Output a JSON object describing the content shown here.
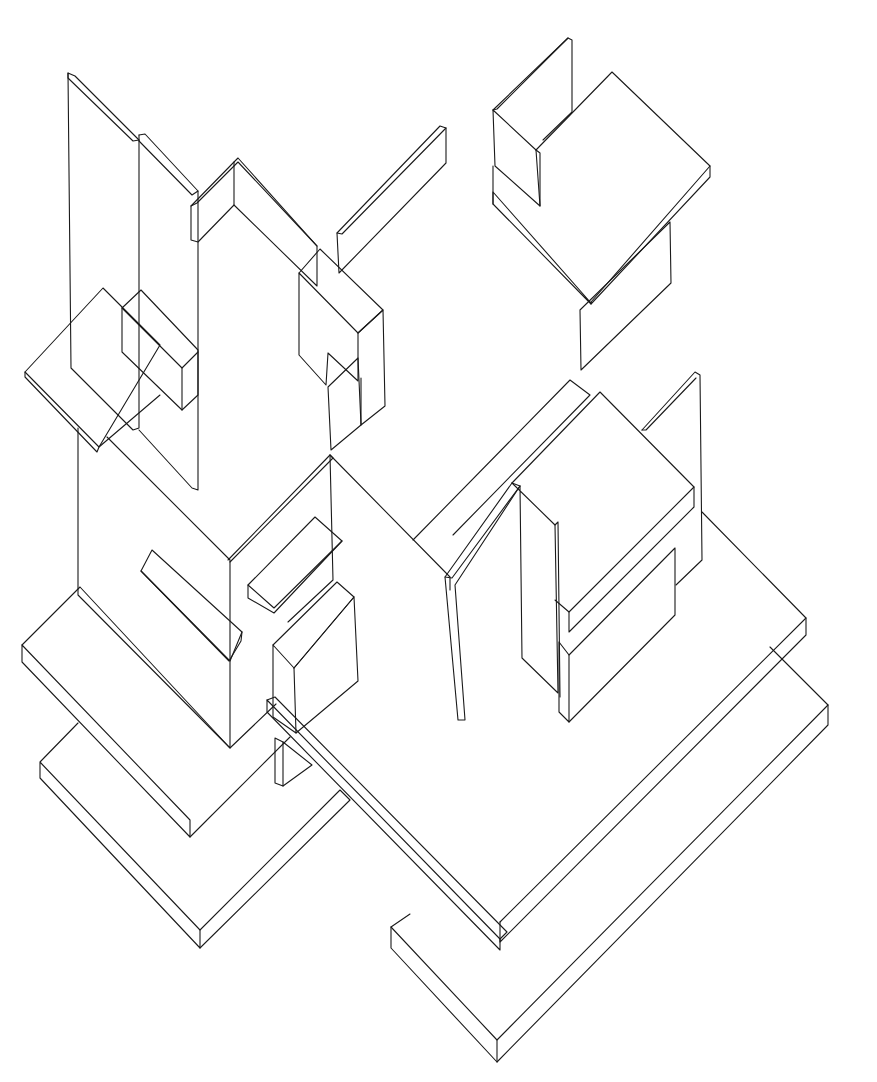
{
  "colors": {
    "background": "#ffffff",
    "ink": "#1a1a1a"
  },
  "shapes": [
    {
      "name": "tall-left-wall",
      "points": "68,73 75,76 139,140 139,428 133,430 71,368 68,73"
    },
    {
      "name": "tall-left-wall-edge",
      "points": "68,73 68,78 133,141 139,140"
    },
    {
      "name": "second-wall",
      "points": "139,135 145,134 198,191 198,490 192,488 139,430"
    },
    {
      "name": "second-wall-edge",
      "points": "139,135 139,141 192,195 198,191"
    },
    {
      "name": "top-l-wall-front",
      "points": "191,206 234,162 238,158 317,246 317,286 234,205 198,242 191,240 191,206"
    },
    {
      "name": "top-l-wall-edge",
      "points": "191,206 197,203 234,166 238,162 317,246"
    },
    {
      "name": "top-l-wall-corner",
      "points": "234,162 234,205"
    },
    {
      "name": "top-right-slat",
      "points": "337,233 440,126 446,128 446,163 339,273 337,233"
    },
    {
      "name": "top-right-slat-edge",
      "points": "337,233 342,234 446,128"
    },
    {
      "name": "middle-box-front",
      "points": "299,273 358,333 358,381 328,353 326,385 299,355 299,273"
    },
    {
      "name": "middle-box-top",
      "points": "299,273 320,249 383,310 358,333"
    },
    {
      "name": "middle-box-side",
      "points": "358,333 383,310 385,406 361,425 361,378"
    },
    {
      "name": "middle-box-lower",
      "points": "328,387 358,358 361,425 331,450 328,387"
    },
    {
      "name": "left-floating-slab-top",
      "points": "25,372 103,288 160,345 99,447 25,372"
    },
    {
      "name": "left-floating-slab-edge",
      "points": "25,372 25,377 97,452 99,447 160,395"
    },
    {
      "name": "left-shelf-box",
      "points": "122,308 141,290 198,350 198,395 182,410 122,352 122,308"
    },
    {
      "name": "left-shelf-box-edge",
      "points": "122,308 182,368 198,352"
    },
    {
      "name": "left-shelf-box-vertical",
      "points": "182,368 182,410"
    },
    {
      "name": "lower-left-wall",
      "points": "78,428 78,595 230,748 230,560 107,437"
    },
    {
      "name": "mid-v-wall-left",
      "points": "228,560 330,455 333,458 230,562"
    },
    {
      "name": "mid-v-wall-right",
      "points": "330,455 333,458 450,577 450,590"
    },
    {
      "name": "mid-center-wall",
      "points": "330,455 333,580 288,622"
    },
    {
      "name": "left-bar",
      "points": "141,571 152,550 242,632 241,641 229,661 141,571"
    },
    {
      "name": "left-bar-edge",
      "points": "141,571 230,661 242,632"
    },
    {
      "name": "center-small-bar",
      "points": "248,585 315,517 342,541 274,613 248,598 248,585"
    },
    {
      "name": "center-small-bar-edge",
      "points": "248,585 274,608 342,541"
    },
    {
      "name": "center-block-front",
      "points": "273,645 294,668 296,733 273,717 273,645"
    },
    {
      "name": "center-block-top",
      "points": "273,645 337,582 354,597 294,668"
    },
    {
      "name": "center-block-side",
      "points": "294,668 354,597 358,681 296,733"
    },
    {
      "name": "left-base-slab-top",
      "points": "22,645 80,587 230,748 276,704"
    },
    {
      "name": "left-base-slab-edge",
      "points": "22,645 22,662 190,837 190,820 22,645"
    },
    {
      "name": "left-base-slab-bottom",
      "points": "190,837 290,737"
    },
    {
      "name": "left-lower-slab",
      "points": "40,762 78,723 40,762 40,778 200,948 200,930 40,762"
    },
    {
      "name": "left-lower-slab-right",
      "points": "200,930 340,790 350,800 200,948"
    },
    {
      "name": "pillar",
      "points": "275,738 283,742 283,786 275,783 275,738"
    },
    {
      "name": "pillar-right",
      "points": "283,742 312,765 283,786"
    },
    {
      "name": "long-diagonal-beam",
      "points": "267,700 267,712 500,950 500,939 267,700"
    },
    {
      "name": "long-diagonal-beam-top",
      "points": "267,700 275,697 507,932 500,939"
    },
    {
      "name": "right-l-wall-left",
      "points": "445,577 512,483 520,486 455,585 465,720 458,720 445,577"
    },
    {
      "name": "right-l-wall-edge",
      "points": "445,577 452,578 520,486"
    },
    {
      "name": "right-tall-panel",
      "points": "512,483 555,525 558,693 522,658 520,486"
    },
    {
      "name": "right-tall-panel-edge",
      "points": "555,525 558,522 560,697"
    },
    {
      "name": "right-upper-box-top",
      "points": "512,483 600,392 694,487 569,612 555,600"
    },
    {
      "name": "right-upper-box-edge",
      "points": "569,612 569,632 694,507 694,487"
    },
    {
      "name": "right-lower-box",
      "points": "559,642 569,655 569,722 559,712 559,642"
    },
    {
      "name": "right-lower-box-top",
      "points": "569,655 675,548 675,615 569,722"
    },
    {
      "name": "right-big-slab-top",
      "points": "413,540 570,380 590,395 453,535"
    },
    {
      "name": "right-back-panel",
      "points": "642,430 695,372 700,375 702,560 676,585"
    },
    {
      "name": "right-back-panel-edge",
      "points": "642,430 646,430 696,378"
    },
    {
      "name": "right-base-slab-top",
      "points": "702,512 806,618 500,922"
    },
    {
      "name": "right-base-slab-edge",
      "points": "806,618 806,635 500,942 500,922"
    },
    {
      "name": "right-lower-slab",
      "points": "391,927 410,914 391,927 391,948 497,1062 828,725 828,705 770,647"
    },
    {
      "name": "right-lower-slab-top",
      "points": "391,927 497,1040 828,705"
    },
    {
      "name": "right-lower-slab-corner",
      "points": "497,1040 497,1062"
    },
    {
      "name": "top-right-chair-back",
      "points": "493,110 568,38 572,40 572,112 543,140"
    },
    {
      "name": "top-right-chair-back-edge",
      "points": "493,110 497,109 568,38"
    },
    {
      "name": "top-right-chair-side",
      "points": "493,110 536,150 540,206 495,166 493,110"
    },
    {
      "name": "top-right-chair-side-edge",
      "points": "536,150 540,153 540,206"
    },
    {
      "name": "top-right-seat-top",
      "points": "536,150 612,72 710,166 591,302"
    },
    {
      "name": "top-right-seat-edge",
      "points": "710,166 710,177 591,304 591,302"
    },
    {
      "name": "top-right-seat-front",
      "points": "493,192 591,303 591,304 493,204 493,192"
    },
    {
      "name": "top-right-seat-left",
      "points": "493,166 493,204"
    },
    {
      "name": "top-right-hanging-panel",
      "points": "580,310 670,222 671,283 581,370 580,310"
    }
  ]
}
